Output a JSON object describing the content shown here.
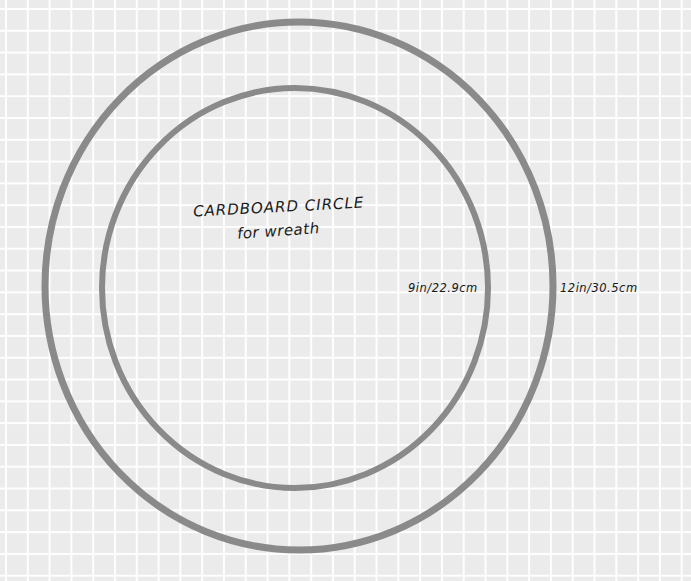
{
  "labels": {
    "title_line1": "CARDBOARD CIRCLE",
    "title_line2": "for wreath",
    "inner_dimension": "9in/22.9cm",
    "outer_dimension": "12in/30.5cm"
  },
  "rings": [
    {
      "name": "outer",
      "cx": 299,
      "cy": 286,
      "rx": 254,
      "ry": 264,
      "diameter_label": "12in/30.5cm"
    },
    {
      "name": "inner",
      "cx": 295,
      "cy": 288,
      "rx": 193,
      "ry": 200,
      "diameter_label": "9in/22.9cm"
    }
  ],
  "colors": {
    "background": "#ebebeb",
    "grid": "#ffffff",
    "ring": "#8a8a8a",
    "ink": "#1a1a1a"
  }
}
